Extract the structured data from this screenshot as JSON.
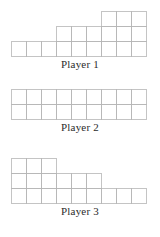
{
  "figure": {
    "background_color": "#ffffff",
    "line_color": "#b5b5b5",
    "label_color": "#2b2b2b",
    "cell_size": 15
  },
  "chart_data": {
    "type": "bar",
    "title": "",
    "subtitle": "",
    "xlabel": "",
    "ylabel": "",
    "grid": true,
    "legend": "none",
    "categories": [
      "1",
      "2",
      "3",
      "4",
      "5",
      "6",
      "7",
      "8",
      "9"
    ],
    "ylim": [
      0,
      3
    ],
    "xlim": [
      0,
      9
    ],
    "unit": "square",
    "series": [
      {
        "name": "Player 1",
        "values": [
          1,
          1,
          1,
          2,
          2,
          2,
          3,
          3,
          3
        ],
        "total": 18
      },
      {
        "name": "Player 2",
        "values": [
          2,
          2,
          2,
          2,
          2,
          2,
          2,
          2,
          2
        ],
        "total": 18
      },
      {
        "name": "Player 3",
        "values": [
          3,
          3,
          3,
          2,
          2,
          2,
          1,
          1,
          1
        ],
        "total": 18
      }
    ]
  },
  "charts": [
    {
      "label": "Player 1",
      "values": [
        1,
        1,
        1,
        2,
        2,
        2,
        3,
        3,
        3
      ]
    },
    {
      "label": "Player 2",
      "values": [
        2,
        2,
        2,
        2,
        2,
        2,
        2,
        2,
        2
      ]
    },
    {
      "label": "Player 3",
      "values": [
        3,
        3,
        3,
        2,
        2,
        2,
        1,
        1,
        1
      ]
    }
  ]
}
